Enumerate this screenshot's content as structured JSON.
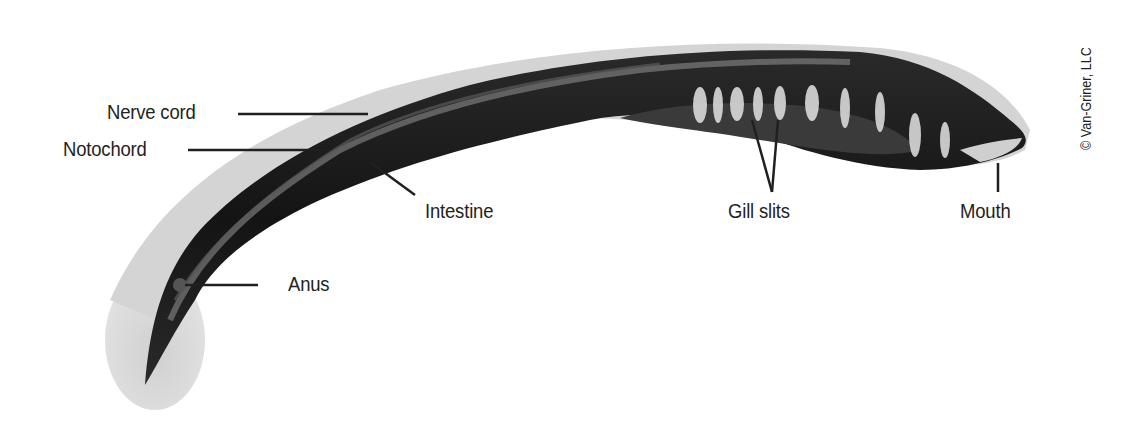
{
  "diagram": {
    "labels": [
      {
        "id": "nerve-cord",
        "text": "Nerve cord"
      },
      {
        "id": "notochord",
        "text": "Notochord"
      },
      {
        "id": "intestine",
        "text": "Intestine"
      },
      {
        "id": "gill-slits",
        "text": "Gill slits"
      },
      {
        "id": "mouth",
        "text": "Mouth"
      },
      {
        "id": "anus",
        "text": "Anus"
      }
    ],
    "credit": "© Van-Griner, LLC",
    "colors": {
      "body_dark": "#1a1a1a",
      "body_outline": "#c8c8c8",
      "tail_fin": "#d6d6d6",
      "highlight": "#9a9a9a",
      "leader_line": "#231f20",
      "text": "#231f20"
    }
  }
}
